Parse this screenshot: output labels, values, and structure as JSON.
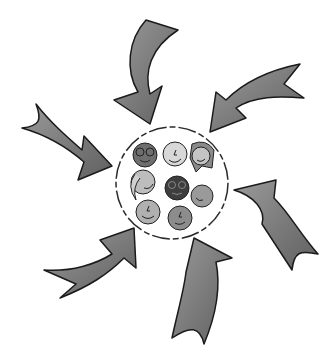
{
  "illustration": {
    "description": "Six curved arrows pointing inward to a dashed circle containing a group of eight faces",
    "colors": {
      "background": "#ffffff",
      "arrow_fill": "#7a7a7a",
      "arrow_stroke": "#1a1a1a",
      "circle_stroke": "#2a2a2a"
    },
    "arrows": [
      {
        "name": "arrow-top"
      },
      {
        "name": "arrow-top-right"
      },
      {
        "name": "arrow-left"
      },
      {
        "name": "arrow-right"
      },
      {
        "name": "arrow-bottom-left"
      },
      {
        "name": "arrow-bottom"
      }
    ],
    "faces": [
      {
        "name": "face-glasses-dark",
        "shade": "#6e6e6e"
      },
      {
        "name": "face-light",
        "shade": "#d8d8d8"
      },
      {
        "name": "face-long-hair",
        "shade": "#8a8a8a"
      },
      {
        "name": "face-side-hair",
        "shade": "#bdbdbd"
      },
      {
        "name": "face-glasses-darkest",
        "shade": "#3e3e3e"
      },
      {
        "name": "face-profile",
        "shade": "#9a9a9a"
      },
      {
        "name": "face-smile",
        "shade": "#b0b0b0"
      },
      {
        "name": "face-medium",
        "shade": "#8c8c8c"
      }
    ]
  }
}
